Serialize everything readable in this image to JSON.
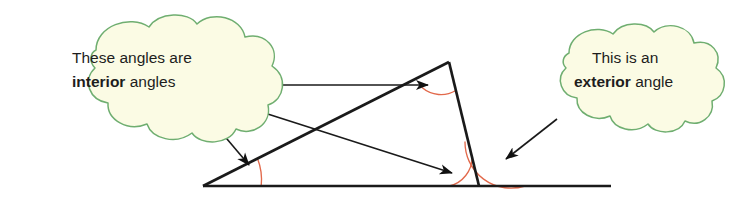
{
  "figure": {
    "type": "geometry-diagram",
    "background_color": "#ffffff"
  },
  "colors": {
    "cloud_fill": "#fbfbe4",
    "cloud_stroke": "#6fae70",
    "line": "#1a1a1a",
    "arc": "#e2694b",
    "text": "#1d1d1d"
  },
  "callouts": [
    {
      "id": "interior",
      "name": "interior-angles-callout",
      "line1_plain": "These angles are",
      "line2_bold": "interior",
      "line2_plain": " angles"
    },
    {
      "id": "exterior",
      "name": "exterior-angle-callout",
      "line1_plain": "This is an",
      "line2_bold": "exterior",
      "line2_plain": " angle"
    }
  ],
  "shapes": {
    "triangle": {
      "name": "triangle",
      "vertices": [
        {
          "label": "left-vertex",
          "x": 203,
          "y": 186
        },
        {
          "label": "apex-vertex",
          "x": 449,
          "y": 62
        },
        {
          "label": "right-vertex",
          "x": 479,
          "y": 186
        }
      ]
    },
    "baseline": {
      "name": "extended-baseline",
      "x1": 203,
      "y1": 186,
      "x2": 611,
      "y2": 186
    }
  },
  "angle_arcs": [
    {
      "name": "interior-angle-arc-left",
      "vertex": "left-vertex",
      "style": "interior"
    },
    {
      "name": "interior-angle-arc-apex",
      "vertex": "apex-vertex",
      "style": "interior"
    },
    {
      "name": "interior-angle-arc-right",
      "vertex": "right-vertex",
      "style": "interior"
    },
    {
      "name": "exterior-angle-arc",
      "vertex": "right-vertex",
      "style": "exterior"
    }
  ],
  "leader_lines": [
    {
      "name": "leader-to-apex-angle",
      "from_callout": "interior",
      "to_vertex": "apex-vertex"
    },
    {
      "name": "leader-to-right-interior-angle",
      "from_callout": "interior",
      "to_vertex": "right-vertex"
    },
    {
      "name": "leader-to-left-interior-angle",
      "from_callout": "interior",
      "to_vertex": "left-vertex"
    },
    {
      "name": "leader-to-exterior-angle",
      "from_callout": "exterior",
      "to_vertex": "right-vertex"
    }
  ]
}
